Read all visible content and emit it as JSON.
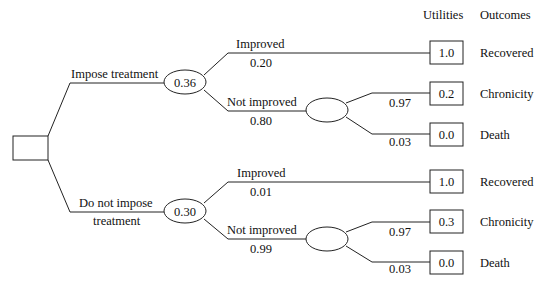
{
  "header": {
    "utilities_label": "Utilities",
    "outcomes_label": "Outcomes"
  },
  "decision_node": {
    "type": "decision",
    "label": ""
  },
  "branches": [
    {
      "label_line1": "Impose treatment",
      "label_line2": "",
      "chance_value": "0.36",
      "improved": {
        "label": "Improved",
        "probability": "0.20",
        "utility": "1.0",
        "outcome": "Recovered"
      },
      "not_improved": {
        "label": "Not improved",
        "probability": "0.80",
        "chance_value": "",
        "chronicity": {
          "probability": "0.97",
          "utility": "0.2",
          "outcome": "Chronicity"
        },
        "death": {
          "probability": "0.03",
          "utility": "0.0",
          "outcome": "Death"
        }
      }
    },
    {
      "label_line1": "Do not impose",
      "label_line2": "treatment",
      "chance_value": "0.30",
      "improved": {
        "label": "Improved",
        "probability": "0.01",
        "utility": "1.0",
        "outcome": "Recovered"
      },
      "not_improved": {
        "label": "Not improved",
        "probability": "0.99",
        "chance_value": "",
        "chronicity": {
          "probability": "0.97",
          "utility": "0.3",
          "outcome": "Chronicity"
        },
        "death": {
          "probability": "0.03",
          "utility": "0.0",
          "outcome": "Death"
        }
      }
    }
  ]
}
